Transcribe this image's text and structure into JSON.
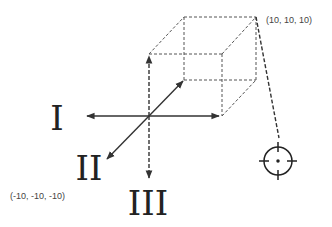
{
  "diagram": {
    "colors": {
      "stroke": "#333333",
      "dashed": "#555555",
      "text": "#222222",
      "coord_text": "#444444",
      "background": "#ffffff"
    },
    "axes": [
      {
        "id": "I",
        "label": "I",
        "direction": "left",
        "style": "solid"
      },
      {
        "id": "II",
        "label": "II",
        "direction": "diagonal-down-left",
        "style": "solid"
      },
      {
        "id": "III",
        "label": "III",
        "direction": "down",
        "style": "dashed"
      }
    ],
    "corner_labels": {
      "max": "(10, 10, 10)",
      "min": "(-10, -10, -10)"
    },
    "icons": {
      "target": "crosshair-target-icon"
    }
  }
}
